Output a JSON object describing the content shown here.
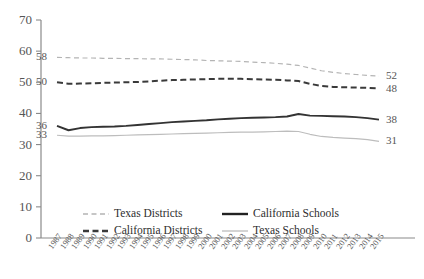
{
  "chart_data": {
    "type": "line",
    "title": "",
    "xlabel": "",
    "ylabel": "",
    "ylim": [
      0,
      70
    ],
    "ytick_step": 10,
    "yticks": [
      0,
      10,
      20,
      30,
      40,
      50,
      60,
      70
    ],
    "grid": false,
    "legend_position": "bottom",
    "x": [
      1987,
      1988,
      1989,
      1990,
      1991,
      1992,
      1993,
      1994,
      1995,
      1996,
      1997,
      1998,
      1999,
      2000,
      2001,
      2002,
      2003,
      2004,
      2005,
      2006,
      2007,
      2008,
      2009,
      2010,
      2011,
      2012,
      2013,
      2014,
      2015
    ],
    "categories": [
      "1987",
      "1988",
      "1989",
      "1990",
      "1991",
      "1992",
      "1993",
      "1994",
      "1995",
      "1996",
      "1997",
      "1998",
      "1999",
      "2000",
      "2001",
      "2002",
      "2003",
      "2004",
      "2005",
      "2006",
      "2007",
      "2008",
      "2009",
      "2010",
      "2011",
      "2012",
      "2013",
      "2014",
      "2015"
    ],
    "series": [
      {
        "name": "Texas Districts",
        "style": "dashed-light",
        "color": "#b4b4b4",
        "start_label": "58",
        "end_label": "52",
        "values": [
          58,
          57.9,
          57.8,
          57.8,
          57.7,
          57.7,
          57.6,
          57.6,
          57.5,
          57.5,
          57.4,
          57.3,
          57.2,
          57.0,
          56.9,
          56.8,
          56.7,
          56.5,
          56.3,
          56.1,
          55.8,
          55.4,
          54.6,
          53.7,
          53.2,
          52.8,
          52.5,
          52.2,
          52.0
        ]
      },
      {
        "name": "California Districts",
        "style": "dashed-dark",
        "color": "#3a3a3a",
        "start_label": "50",
        "end_label": "48",
        "values": [
          50.0,
          49.5,
          49.6,
          49.7,
          49.8,
          49.9,
          50.0,
          50.1,
          50.3,
          50.5,
          50.7,
          50.8,
          50.9,
          51.0,
          51.1,
          51.1,
          51.1,
          51.0,
          50.9,
          50.8,
          50.6,
          50.4,
          49.5,
          48.8,
          48.5,
          48.4,
          48.3,
          48.2,
          48.0
        ]
      },
      {
        "name": "California Schools",
        "style": "solid-dark",
        "color": "#333333",
        "start_label": "36",
        "end_label": "38",
        "values": [
          36.0,
          34.6,
          35.3,
          35.6,
          35.7,
          35.8,
          36.0,
          36.3,
          36.6,
          36.9,
          37.2,
          37.4,
          37.6,
          37.8,
          38.1,
          38.3,
          38.5,
          38.6,
          38.7,
          38.8,
          39.0,
          39.8,
          39.3,
          39.2,
          39.1,
          39.0,
          38.8,
          38.5,
          38.0
        ]
      },
      {
        "name": "Texas Schools",
        "style": "solid-light",
        "color": "#bdbdbd",
        "start_label": "33",
        "end_label": "31",
        "values": [
          33.0,
          32.7,
          32.7,
          32.8,
          32.8,
          32.9,
          33.0,
          33.1,
          33.2,
          33.3,
          33.4,
          33.5,
          33.6,
          33.7,
          33.8,
          33.9,
          34.0,
          34.0,
          34.1,
          34.2,
          34.3,
          34.2,
          33.3,
          32.6,
          32.3,
          32.1,
          31.9,
          31.6,
          31.0
        ]
      }
    ],
    "legend": [
      {
        "label": "Texas Districts",
        "style": "dashed-light"
      },
      {
        "label": "California Schools",
        "style": "solid-dark"
      },
      {
        "label": "California Districts",
        "style": "dashed-dark"
      },
      {
        "label": "Texas Schools",
        "style": "solid-light"
      }
    ]
  },
  "axis": {
    "axis_color": "#8a8a8a"
  }
}
